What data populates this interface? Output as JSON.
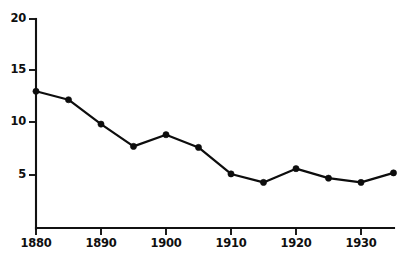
{
  "chart_data": {
    "type": "line",
    "title": "",
    "subtitle": "",
    "xlabel": "",
    "ylabel": "",
    "x": [
      1880,
      1885,
      1890,
      1895,
      1900,
      1905,
      1910,
      1915,
      1920,
      1925,
      1930,
      1935
    ],
    "values": [
      12.9,
      12.1,
      9.8,
      7.7,
      8.8,
      7.6,
      5.1,
      4.3,
      5.6,
      4.7,
      4.3,
      5.2
    ],
    "series": [
      {
        "name": "",
        "values": [
          12.9,
          12.1,
          9.8,
          7.7,
          8.8,
          7.6,
          5.1,
          4.3,
          5.6,
          4.7,
          4.3,
          5.2
        ]
      }
    ],
    "xlim": [
      1880,
      1936
    ],
    "ylim": [
      0,
      20
    ],
    "ytick_values": [
      5,
      10,
      15,
      20
    ],
    "ytick_labels": [
      "5",
      "10",
      "15",
      "20"
    ],
    "xtick_values": [
      1880,
      1890,
      1900,
      1910,
      1920,
      1930
    ],
    "xtick_labels": [
      "1880",
      "1890",
      "1900",
      "1910",
      "1920",
      "1930"
    ],
    "xminor_tick_values": [
      1880,
      1890,
      1900,
      1910,
      1920,
      1930
    ],
    "grid": false,
    "legend": "none",
    "marker": "filled-circle",
    "line_color": "#0d0d0d",
    "marker_color": "#0d0d0d",
    "axis_color": "#111111",
    "background_color": "#ffffff",
    "annotations": []
  },
  "ytick_labels": [
    {
      "text": "20",
      "top": 13,
      "right": 372
    },
    {
      "text": "15",
      "top": 64,
      "right": 372
    },
    {
      "text": "10",
      "top": 116,
      "right": 372
    },
    {
      "text": "5",
      "top": 169,
      "right": 372
    }
  ],
  "xtick_labels": [
    {
      "text": "1880",
      "left": 19,
      "top": 236
    },
    {
      "text": "1890",
      "left": 84,
      "top": 236
    },
    {
      "text": "1900",
      "left": 149,
      "top": 236
    },
    {
      "text": "1910",
      "left": 214,
      "top": 236
    },
    {
      "text": "1920",
      "left": 279,
      "top": 236
    },
    {
      "text": "1930",
      "left": 344,
      "top": 236
    }
  ]
}
